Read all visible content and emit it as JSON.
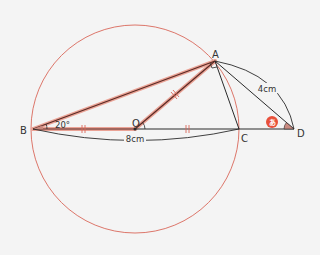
{
  "diagram": {
    "type": "geometry",
    "colors": {
      "background": "#f4f4f4",
      "circle": "#d9685a",
      "highlight": "#e0806f",
      "line": "#2a2a2a",
      "angle_fill": "#c98a80",
      "badge": "#e8503a"
    },
    "points": {
      "A": {
        "label": "A",
        "x": 215,
        "y": 61
      },
      "B": {
        "label": "B",
        "x": 33,
        "y": 129
      },
      "O": {
        "label": "O",
        "x": 135,
        "y": 129
      },
      "C": {
        "label": "C",
        "x": 239,
        "y": 129
      },
      "D": {
        "label": "D",
        "x": 294,
        "y": 129
      }
    },
    "circle": {
      "center": "O",
      "radius": 104
    },
    "segments": [
      {
        "from": "B",
        "to": "A",
        "style": "highlight"
      },
      {
        "from": "O",
        "to": "A",
        "style": "highlight"
      },
      {
        "from": "B",
        "to": "O",
        "style": "highlight"
      },
      {
        "from": "O",
        "to": "D",
        "style": "line"
      },
      {
        "from": "A",
        "to": "C",
        "style": "line"
      },
      {
        "from": "A",
        "to": "D",
        "style": "line"
      }
    ],
    "angles": {
      "ABC": {
        "label": "20°"
      },
      "BAC": {
        "label": "right-angle"
      },
      "ADB": {
        "label": "あ"
      }
    },
    "measurements": {
      "BC": {
        "label": "8cm"
      },
      "AD": {
        "label": "4cm"
      }
    },
    "equal_marks": [
      "BO",
      "OC",
      "OA"
    ]
  }
}
